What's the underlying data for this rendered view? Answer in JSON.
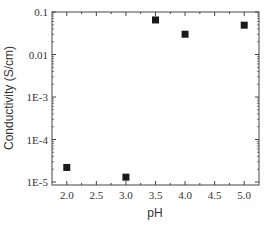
{
  "chart_data": {
    "type": "scatter",
    "title": "",
    "xlabel": "pH",
    "ylabel": "Conductivity (S/cm)",
    "xlim": [
      1.75,
      5.25
    ],
    "ylim": [
      1e-05,
      0.1
    ],
    "yscale": "log",
    "grid": false,
    "legend": null,
    "x_ticks": [
      "2.0",
      "2.5",
      "3.0",
      "3.5",
      "4.0",
      "4.5",
      "5.0"
    ],
    "y_ticks": [
      "0.1",
      "0.01",
      "1E-3",
      "1E-4",
      "1E-5"
    ],
    "series": [
      {
        "name": "Conductivity",
        "marker": "square",
        "color": "#1a1a1a",
        "x": [
          2.0,
          3.0,
          3.5,
          4.0,
          5.0
        ],
        "y": [
          2.2e-05,
          1.3e-05,
          0.065,
          0.03,
          0.049
        ]
      }
    ]
  }
}
